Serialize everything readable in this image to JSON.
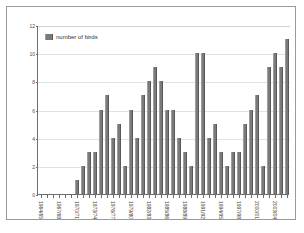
{
  "chart_data": {
    "type": "bar",
    "title": "",
    "xlabel": "",
    "ylabel": "",
    "ylim": [
      0,
      12
    ],
    "yticks": [
      0,
      2,
      4,
      6,
      8,
      10,
      12
    ],
    "grid": true,
    "legend": {
      "position": "top-left",
      "entries": [
        {
          "name": "number of birds",
          "color": "#7a7a7a"
        }
      ]
    },
    "series_name": "number of birds",
    "bar_color": "#7a7a7a",
    "categories": [
      "1964/65",
      "1965/66",
      "1966/67",
      "1967/68",
      "1968/69",
      "1969/70",
      "1970/71",
      "1971/72",
      "1972/73",
      "1973/74",
      "1974/75",
      "1975/76",
      "1976/77",
      "1977/78",
      "1978/79",
      "1979/80",
      "1980/81",
      "1981/82",
      "1982/83",
      "1983/84",
      "1984/85",
      "1985/86",
      "1986/87",
      "1987/88",
      "1988/89",
      "1989/90",
      "1990/91",
      "1991/92",
      "1992/93",
      "1993/94",
      "1994/95",
      "1995/96",
      "1996/97",
      "1997/98",
      "1998/99",
      "1999/00",
      "2000/01",
      "2001/02",
      "2002/03",
      "2003/04",
      "2004/05",
      "2005/06"
    ],
    "values": [
      0,
      0,
      0,
      0,
      0,
      0,
      1,
      2,
      3,
      3,
      6,
      7,
      4,
      5,
      2,
      6,
      4,
      7,
      8,
      9,
      8,
      6,
      6,
      4,
      3,
      2,
      10,
      10,
      4,
      5,
      3,
      2,
      3,
      3,
      5,
      6,
      7,
      2,
      9,
      10,
      9,
      11
    ],
    "tick_labels_shown": [
      "1964/65",
      "",
      "",
      "1967/68",
      "",
      "",
      "1970/71",
      "",
      "",
      "1973/74",
      "",
      "",
      "1976/77",
      "",
      "",
      "1979/80",
      "",
      "",
      "1982/83",
      "",
      "",
      "1985/86",
      "",
      "",
      "1988/89",
      "",
      "",
      "1991/92",
      "",
      "",
      "1994/95",
      "",
      "",
      "1997/98",
      "",
      "",
      "2000/01",
      "",
      "",
      "2003/04",
      "",
      ""
    ]
  }
}
